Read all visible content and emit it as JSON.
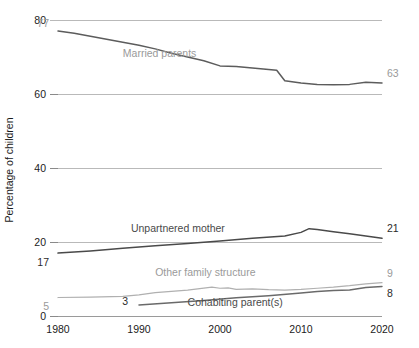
{
  "chart_data": {
    "type": "line",
    "title": "",
    "xlabel": "",
    "ylabel": "Percentage of children",
    "xlim": [
      1980,
      2020
    ],
    "ylim": [
      0,
      80
    ],
    "ytick_labels": [
      "0",
      "20",
      "40",
      "60",
      "80"
    ],
    "yticks": [
      0,
      20,
      40,
      60,
      80
    ],
    "xtick_labels": [
      "1980",
      "1990",
      "2000",
      "2010",
      "2020"
    ],
    "xticks": [
      1980,
      1990,
      2000,
      2010,
      2020
    ],
    "grid": "horizontal",
    "legend": "inline-labels",
    "series": [
      {
        "name": "Married parents",
        "color": "#5c5c5c",
        "label_x": 1988,
        "label_y": 70,
        "start_label": "77",
        "end_label": "63",
        "x": [
          1980,
          1982,
          1984,
          1986,
          1988,
          1990,
          1992,
          1994,
          1996,
          1998,
          2000,
          2002,
          2004,
          2006,
          2007,
          2008,
          2010,
          2012,
          2014,
          2016,
          2018,
          2020
        ],
        "values": [
          77,
          76.4,
          75.6,
          74.8,
          74.0,
          73.2,
          72.2,
          71.0,
          70.0,
          69.0,
          67.6,
          67.4,
          67.0,
          66.6,
          66.4,
          63.6,
          63.0,
          62.6,
          62.5,
          62.6,
          63.2,
          63
        ]
      },
      {
        "name": "Unpartnered mother",
        "color": "#4a4a4a",
        "label_x": 1989,
        "label_y": 22.6,
        "start_label": "17",
        "end_label": "21",
        "x": [
          1980,
          1984,
          1988,
          1992,
          1996,
          2000,
          2004,
          2008,
          2010,
          2011,
          2012,
          2014,
          2016,
          2018,
          2020
        ],
        "values": [
          17,
          17.6,
          18.3,
          19.0,
          19.6,
          20.3,
          21.0,
          21.6,
          22.6,
          23.6,
          23.4,
          22.8,
          22.2,
          21.6,
          21
        ]
      },
      {
        "name": "Other family structure",
        "color": "#b0b0b0",
        "label_x": 1992,
        "label_y": 10.8,
        "start_label": "5",
        "end_label": "9",
        "x": [
          1980,
          1984,
          1988,
          1990,
          1992,
          1996,
          1999,
          2000,
          2001,
          2002,
          2004,
          2006,
          2008,
          2010,
          2012,
          2014,
          2016,
          2018,
          2020
        ],
        "values": [
          5,
          5.1,
          5.3,
          5.7,
          6.3,
          7.0,
          7.8,
          7.5,
          7.6,
          7.2,
          7.3,
          7.1,
          7.0,
          7.2,
          7.5,
          7.8,
          8.2,
          8.7,
          9
        ]
      },
      {
        "name": "Cohabiting parent(s)",
        "color": "#6a6a6a",
        "label_x": 1996,
        "label_y": 2.6,
        "start_label": "3",
        "end_label": "8",
        "x": [
          1990,
          1994,
          1998,
          2002,
          2006,
          2010,
          2012,
          2014,
          2016,
          2018,
          2020
        ],
        "values": [
          3,
          3.6,
          4.2,
          4.9,
          5.5,
          6.2,
          6.6,
          6.9,
          7.0,
          7.7,
          8
        ]
      }
    ]
  },
  "colors": {
    "grid": "#b9b9b9",
    "axis": "#9a9a9a",
    "tick_text": "#1b1b1b",
    "label_gray": "#9a9a9a",
    "background": "#ffffff"
  }
}
